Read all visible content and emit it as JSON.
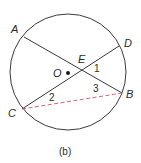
{
  "diagram": {
    "caption": "(b)",
    "circle": {
      "center": "O",
      "stroke": "#3a3a3a"
    },
    "points": {
      "A": "A",
      "B": "B",
      "C": "C",
      "D": "D",
      "E": "E",
      "O": "O"
    },
    "angles": {
      "1": "1",
      "2": "2",
      "3": "3"
    },
    "segments": [
      {
        "from": "A",
        "to": "B",
        "style": "solid"
      },
      {
        "from": "C",
        "to": "D",
        "style": "solid"
      },
      {
        "from": "C",
        "to": "B",
        "style": "dashed",
        "color": "#e06070"
      }
    ],
    "colors": {
      "line": "#3a3a3a",
      "dashed": "#e06070",
      "text": "#2a2a2a"
    }
  }
}
